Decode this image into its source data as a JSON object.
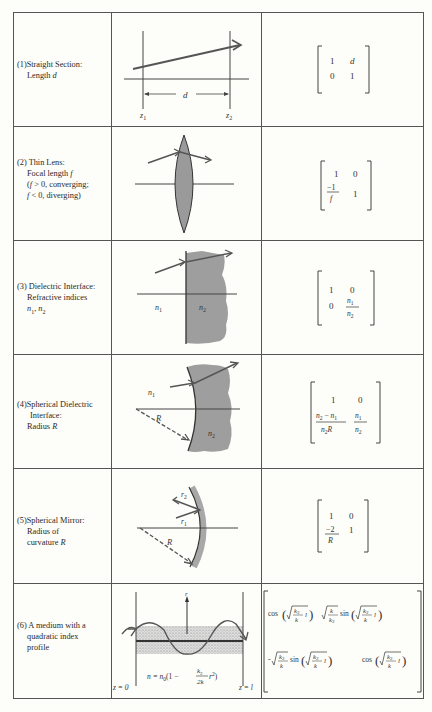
{
  "table": {
    "title": "Ray transfer matrices of optical elements",
    "rows": [
      {
        "number": "(1)",
        "label_lines": [
          "Straight Section:",
          "Length d"
        ],
        "diagram": {
          "type": "straight-section",
          "labels": {
            "distance": "d",
            "z_start": "z1",
            "z_end": "z2"
          }
        },
        "matrix": [
          [
            "1",
            "d"
          ],
          [
            "0",
            "1"
          ]
        ]
      },
      {
        "number": "(2)",
        "label_lines": [
          "Thin Lens:",
          "Focal length f",
          "(f > 0, converging;",
          "f < 0, diverging)"
        ],
        "diagram": {
          "type": "thin-lens"
        },
        "matrix": [
          [
            "1",
            "0"
          ],
          [
            "−1/f",
            "1"
          ]
        ]
      },
      {
        "number": "(3)",
        "label_lines": [
          "Dielectric Interface:",
          "Refractive indices",
          "n1, n2"
        ],
        "diagram": {
          "type": "dielectric-interface",
          "labels": {
            "left": "n1",
            "right": "n2"
          }
        },
        "matrix": [
          [
            "1",
            "0"
          ],
          [
            "0",
            "n1/n2"
          ]
        ]
      },
      {
        "number": "(4)",
        "label_lines": [
          "Spherical Dielectric",
          "Interface:",
          "Radius R"
        ],
        "diagram": {
          "type": "spherical-dielectric-interface",
          "labels": {
            "left": "n1",
            "right": "n2",
            "radius": "R"
          }
        },
        "matrix": [
          [
            "1",
            "0"
          ],
          [
            "(n2 − n1)/(n2 R)",
            "n1/n2"
          ]
        ]
      },
      {
        "number": "(5)",
        "label_lines": [
          "Spherical Mirror:",
          "Radius of",
          "curvature R"
        ],
        "diagram": {
          "type": "spherical-mirror",
          "labels": {
            "ray_in": "r1",
            "ray_out": "r2",
            "radius": "R"
          }
        },
        "matrix": [
          [
            "1",
            "0"
          ],
          [
            "−2/R",
            "1"
          ]
        ]
      },
      {
        "number": "(6)",
        "label_lines": [
          "A medium with a",
          "quadratic index",
          "profile"
        ],
        "diagram": {
          "type": "quadratic-index-medium",
          "labels": {
            "axis": "r",
            "z_start": "z = 0",
            "z_end": "z = l",
            "formula": "n = n0(1 − (k2/2k) r²)"
          }
        },
        "matrix": [
          [
            "cos(√(k2/k) l)",
            "√(k/k2) sin(√(k2/k) l)"
          ],
          [
            "−√(k2/k) sin(√(k2/k) l)",
            "cos(√(k2/k) l)"
          ]
        ]
      }
    ]
  },
  "text": {
    "r1_num": "(1)",
    "r1_l1": "Straight Section:",
    "r1_l2a": "Length ",
    "r1_l2b": "d",
    "r1_d": "d",
    "r1_z": "z",
    "r1_sub1": "1",
    "r1_sub2": "2",
    "r1_m11": "1",
    "r1_m12": "d",
    "r1_m21": "0",
    "r1_m22": "1",
    "r2_num": "(2)",
    "r2_l1": "Thin Lens:",
    "r2_l2a": "Focal length ",
    "r2_l2b": "f",
    "r2_l3a": "(",
    "r2_l3b": "f",
    "r2_l3c": " > 0, converging;",
    "r2_l4a": "f",
    "r2_l4b": " < 0, diverging)",
    "r2_m11": "1",
    "r2_m12": "0",
    "r2_m21n": "−1",
    "r2_m21d": "f",
    "r2_m22": "1",
    "r3_num": "(3)",
    "r3_l1": "Dielectric Interface:",
    "r3_l2": "Refractive indices",
    "r3_l3": "n",
    "r3_s1": "1",
    "r3_sep": ", ",
    "r3_s2": "2",
    "r3_n": "n",
    "r3_m11": "1",
    "r3_m12": "0",
    "r3_m21": "0",
    "r4_num": "(4)",
    "r4_l1": "Spherical Dielectric",
    "r4_l2": "Interface:",
    "r4_l3a": "Radius ",
    "r4_l3b": "R",
    "r4_R": "R",
    "r4_n": "n",
    "r4_m11": "1",
    "r4_m12": "0",
    "r4_minus": " − ",
    "r5_num": "(5)",
    "r5_l1": "Spherical Mirror:",
    "r5_l2": "Radius of",
    "r5_l3a": "curvature ",
    "r5_l3b": "R",
    "r5_r": "r",
    "r5_R": "R",
    "r5_m11": "1",
    "r5_m12": "0",
    "r5_m21n": "−2",
    "r5_m21d": "R",
    "r5_m22": "1",
    "r6_num": "(6)",
    "r6_l1": "A medium with a",
    "r6_l2": "quadratic index",
    "r6_l3": "profile",
    "r6_raxis": "r",
    "r6_z0": "z = 0",
    "r6_zl": "z = l",
    "r6_formula_a": "n = n",
    "r6_formula_b": "(1 − ",
    "r6_formula_c": " r",
    "r6_k2": "k",
    "r6_2k": "2k",
    "r6_cos": "cos",
    "r6_sin": "sin",
    "r6_k": "k",
    "r6_l": "l",
    "r6_minus": "-"
  }
}
